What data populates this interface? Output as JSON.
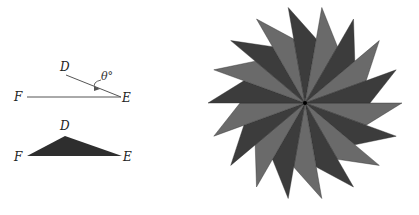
{
  "angle_diagram": {
    "labels": {
      "D": "D",
      "E": "E",
      "F": "F",
      "angle": "θ°"
    },
    "line_color": "#555555"
  },
  "triangle_diagram": {
    "labels": {
      "D": "D",
      "E": "E",
      "F": "F"
    },
    "fill": "#2e2e2e"
  },
  "pinwheel": {
    "piece_count": 18,
    "center": [
      305,
      103
    ],
    "tip_radius": 97,
    "notch_radius": 65,
    "step_degrees": 20,
    "colors": {
      "dark": "#3c3c3c",
      "light": "#6a6a6a"
    }
  }
}
